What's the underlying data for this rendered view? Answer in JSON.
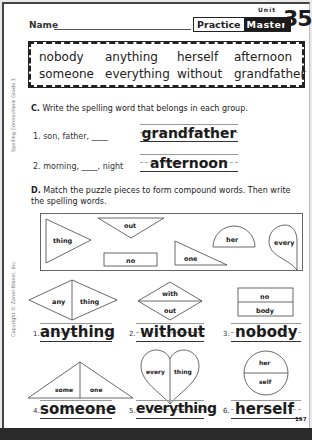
{
  "header": {
    "name_label": "Name",
    "practice_label": "Practice",
    "master_label": "Master",
    "unit_label": "Unit",
    "unit_number": "35"
  },
  "word_box": {
    "words": [
      "nobody",
      "anything",
      "herself",
      "afternoon",
      "someone",
      "everything",
      "without",
      "grandfather"
    ]
  },
  "side_text": {
    "series": "Spelling Connections Grade 1",
    "copyright": "Copyright © Zaner-Bloser, Inc."
  },
  "section_c": {
    "letter": "C.",
    "instruction": "Write the spelling word that belongs in each group.",
    "items": [
      {
        "number": "1.",
        "prompt": "son, father, ____",
        "answer": "grandfather"
      },
      {
        "number": "2.",
        "prompt": "morning, ____, night",
        "answer": "afternoon"
      }
    ]
  },
  "section_d": {
    "letter": "D.",
    "instruction": "Match the puzzle pieces to form compound words. Then write the spelling words.",
    "loose_pieces": [
      "thing",
      "out",
      "no",
      "one",
      "her",
      "every"
    ],
    "items": [
      {
        "number": "1.",
        "parts": [
          "any",
          "thing"
        ],
        "answer": "anything"
      },
      {
        "number": "2.",
        "parts": [
          "with",
          "out"
        ],
        "answer": "without"
      },
      {
        "number": "3.",
        "parts": [
          "no",
          "body"
        ],
        "answer": "nobody"
      },
      {
        "number": "4.",
        "parts": [
          "some",
          "one"
        ],
        "answer": "someone"
      },
      {
        "number": "5.",
        "parts": [
          "every",
          "thing"
        ],
        "answer": "everything"
      },
      {
        "number": "6.",
        "parts": [
          "her",
          "self"
        ],
        "answer": "herself"
      }
    ]
  },
  "footer": {
    "page_number": "197"
  }
}
